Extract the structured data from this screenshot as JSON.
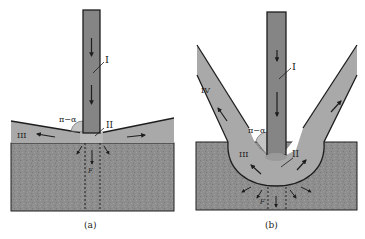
{
  "figure": {
    "panels": [
      {
        "id": "a",
        "caption": "(a)",
        "labels": {
          "jet": "I",
          "stagnation": "II",
          "lateral_flow": "III",
          "angle": "π−α",
          "pressure": "F"
        }
      },
      {
        "id": "b",
        "caption": "(b)",
        "labels": {
          "jet": "I",
          "stagnation": "II",
          "crater_flow": "III",
          "reverse_flow": "IV",
          "angle": "π−α",
          "pressure": "F"
        }
      }
    ],
    "colors": {
      "jet_fill": "#8a8a8a",
      "jet_core": "#7a7a7a",
      "flow_fill": "#a8a8a8",
      "substrate_fill": "#8c8c8c",
      "outline": "#1e1e1e",
      "stagnation_fill": "#b5b5b5",
      "background": "#ffffff"
    }
  }
}
